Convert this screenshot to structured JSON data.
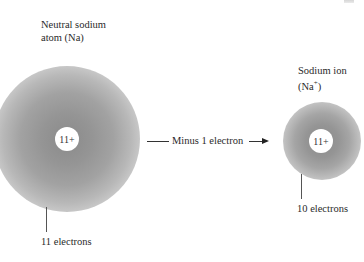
{
  "diagram": {
    "neutral_atom": {
      "title_line1": "Neutral sodium",
      "title_line2": "atom (Na)",
      "nucleus_charge": "11+",
      "electron_label": "11 electrons"
    },
    "transition": {
      "label": "Minus 1 electron"
    },
    "ion": {
      "title_line1": "Sodium ion",
      "title_line2_base": "(Na",
      "title_line2_sup": "+",
      "title_line2_end": ")",
      "nucleus_charge": "11+",
      "electron_label": "10 electrons"
    },
    "colors": {
      "cloud_core": "#8a8a8a",
      "nucleus": "#ffffff",
      "text": "#2a2a2a"
    }
  }
}
